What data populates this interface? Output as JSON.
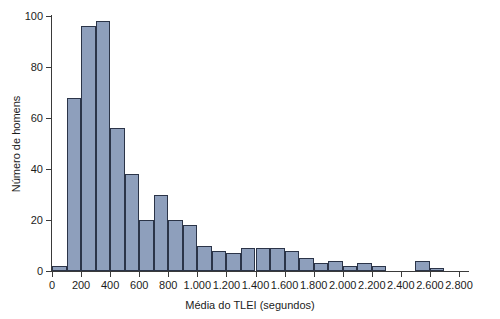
{
  "chart_data": {
    "type": "bar",
    "title": "",
    "xlabel": "Média do TLEI (segundos)",
    "ylabel": "Número de homens",
    "xlim": [
      0,
      2800
    ],
    "ylim": [
      0,
      100
    ],
    "bin_width": 100,
    "grid": false,
    "legend": null,
    "bar_color": "#8e9fbc",
    "bar_edge_color": "#2b3448",
    "axis_color": "#3a3a3a",
    "x_tick_labels": [
      "0",
      "200",
      "400",
      "600",
      "800",
      "1.000",
      "1.200",
      "1.400",
      "1.600",
      "1.800",
      "2.000",
      "2.200",
      "2.400",
      "2.600",
      "2.800"
    ],
    "x_tick_values": [
      0,
      200,
      400,
      600,
      800,
      1000,
      1200,
      1400,
      1600,
      1800,
      2000,
      2200,
      2400,
      2600,
      2800
    ],
    "y_tick_labels": [
      "0",
      "20",
      "40",
      "60",
      "80",
      "100"
    ],
    "y_tick_values": [
      0,
      20,
      40,
      60,
      80,
      100
    ],
    "categories": [
      "0-100",
      "100-200",
      "200-300",
      "300-400",
      "400-500",
      "500-600",
      "600-700",
      "700-800",
      "800-900",
      "900-1000",
      "1000-1100",
      "1100-1200",
      "1200-1300",
      "1300-1400",
      "1400-1500",
      "1500-1600",
      "1600-1700",
      "1700-1800",
      "1800-1900",
      "1900-2000",
      "2000-2100",
      "2100-2200",
      "2200-2300",
      "2300-2400",
      "2400-2500",
      "2500-2600",
      "2600-2700",
      "2700-2800"
    ],
    "bin_starts": [
      0,
      100,
      200,
      300,
      400,
      500,
      600,
      700,
      800,
      900,
      1000,
      1100,
      1200,
      1300,
      1400,
      1500,
      1600,
      1700,
      1800,
      1900,
      2000,
      2100,
      2200,
      2300,
      2400,
      2500,
      2600,
      2700
    ],
    "values": [
      2,
      68,
      96,
      98,
      56,
      38,
      20,
      30,
      20,
      18,
      10,
      8,
      7,
      9,
      9,
      9,
      8,
      5,
      3,
      4,
      2,
      3,
      2,
      0,
      0,
      4,
      1,
      0
    ]
  }
}
